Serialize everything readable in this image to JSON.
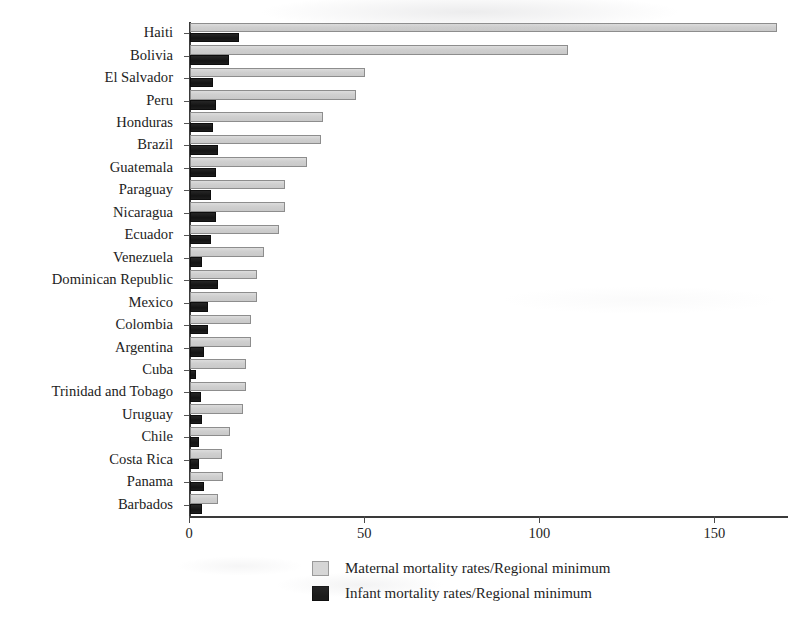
{
  "chart_data": {
    "type": "bar",
    "orientation": "horizontal",
    "title": "",
    "xlabel": "",
    "ylabel": "",
    "xlim": [
      0,
      171
    ],
    "grid": false,
    "legend_position": "bottom",
    "categories": [
      "Haiti",
      "Bolivia",
      "El Salvador",
      "Peru",
      "Honduras",
      "Brazil",
      "Guatemala",
      "Paraguay",
      "Nicaragua",
      "Ecuador",
      "Venezuela",
      "Dominican Republic",
      "Mexico",
      "Colombia",
      "Argentina",
      "Cuba",
      "Trinidad and Tobago",
      "Uruguay",
      "Chile",
      "Costa Rica",
      "Panama",
      "Barbados"
    ],
    "series": [
      {
        "name": "Maternal mortality rates/Regional minimum",
        "color": "#d2d2d2",
        "values": [
          167.5,
          108.0,
          50.0,
          47.5,
          38.0,
          37.5,
          33.5,
          27.0,
          27.0,
          25.5,
          21.0,
          19.0,
          19.0,
          17.5,
          17.5,
          16.0,
          16.0,
          15.0,
          11.5,
          9.0,
          9.5,
          8.0
        ]
      },
      {
        "name": "Infant mortality rates/Regional minimum",
        "color": "#1c1c1c",
        "values": [
          14.0,
          11.0,
          6.5,
          7.5,
          6.5,
          8.0,
          7.5,
          6.0,
          7.5,
          6.0,
          3.5,
          8.0,
          5.0,
          5.0,
          4.0,
          1.8,
          3.0,
          3.5,
          2.7,
          2.5,
          4.0,
          3.5
        ]
      }
    ],
    "xticks": [
      0,
      50,
      100,
      150
    ],
    "xticklabels": [
      "0",
      "50",
      "100",
      "150"
    ],
    "legend": [
      {
        "label": "Maternal mortality rates/Regional minimum",
        "swatch": "maternal"
      },
      {
        "label": "Infant mortality rates/Regional minimum",
        "swatch": "infant"
      }
    ]
  }
}
